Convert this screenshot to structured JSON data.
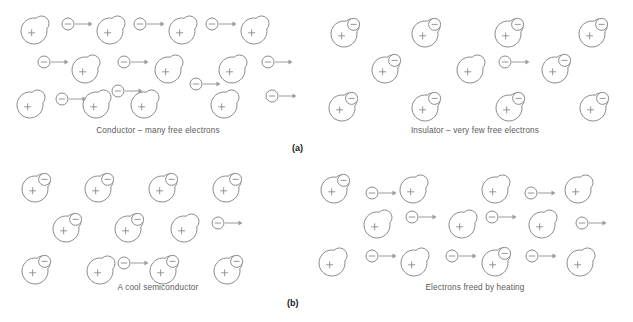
{
  "figure": {
    "width": 633,
    "height": 322,
    "background": "#ffffff",
    "stroke_color": "#8a8a8a",
    "arrow_color": "#9a9a9a",
    "caption_color": "#5b5b5b",
    "label_color": "#1a1a1a"
  },
  "geometry": {
    "atom_radius": 13,
    "electron_radius": 6,
    "arrow_length": 17
  },
  "panel_labels": [
    {
      "text": "(a)",
      "x": 292,
      "y": 143
    },
    {
      "text": "(b)",
      "x": 287,
      "y": 298
    }
  ],
  "panels": [
    {
      "id": "conductor",
      "name": "conductor-panel",
      "caption": "Conductor – many free electrons",
      "x": 0,
      "y": 0,
      "width": 316,
      "height": 160,
      "caption_y": 126,
      "atoms": [
        {
          "x": 34,
          "y": 31,
          "bound_electron": false
        },
        {
          "x": 110,
          "y": 31,
          "bound_electron": false
        },
        {
          "x": 182,
          "y": 31,
          "bound_electron": false
        },
        {
          "x": 254,
          "y": 31,
          "bound_electron": false
        },
        {
          "x": 85,
          "y": 70,
          "bound_electron": false
        },
        {
          "x": 168,
          "y": 70,
          "bound_electron": false
        },
        {
          "x": 232,
          "y": 70,
          "bound_electron": false
        },
        {
          "x": 30,
          "y": 105,
          "bound_electron": false
        },
        {
          "x": 96,
          "y": 105,
          "bound_electron": false
        },
        {
          "x": 144,
          "y": 105,
          "bound_electron": false
        },
        {
          "x": 224,
          "y": 105,
          "bound_electron": false
        }
      ],
      "electrons": [
        {
          "x": 68,
          "y": 24,
          "arrow": true
        },
        {
          "x": 140,
          "y": 24,
          "arrow": true
        },
        {
          "x": 212,
          "y": 24,
          "arrow": true
        },
        {
          "x": 44,
          "y": 62,
          "arrow": true
        },
        {
          "x": 124,
          "y": 62,
          "arrow": true
        },
        {
          "x": 196,
          "y": 84,
          "arrow": true
        },
        {
          "x": 268,
          "y": 62,
          "arrow": true
        },
        {
          "x": 272,
          "y": 96,
          "arrow": true
        },
        {
          "x": 62,
          "y": 99,
          "arrow": true
        },
        {
          "x": 118,
          "y": 91,
          "arrow": true
        }
      ]
    },
    {
      "id": "insulator",
      "name": "insulator-panel",
      "caption": "Insulator – very few free electrons",
      "x": 317,
      "y": 0,
      "width": 316,
      "height": 160,
      "caption_y": 126,
      "atoms": [
        {
          "x": 27,
          "y": 34,
          "bound_electron": true
        },
        {
          "x": 108,
          "y": 34,
          "bound_electron": true
        },
        {
          "x": 191,
          "y": 34,
          "bound_electron": true
        },
        {
          "x": 275,
          "y": 34,
          "bound_electron": true
        },
        {
          "x": 68,
          "y": 70,
          "bound_electron": true
        },
        {
          "x": 153,
          "y": 70,
          "bound_electron": false
        },
        {
          "x": 238,
          "y": 70,
          "bound_electron": true
        },
        {
          "x": 25,
          "y": 108,
          "bound_electron": true
        },
        {
          "x": 108,
          "y": 108,
          "bound_electron": true
        },
        {
          "x": 192,
          "y": 108,
          "bound_electron": true
        },
        {
          "x": 276,
          "y": 108,
          "bound_electron": true
        }
      ],
      "electrons": [
        {
          "x": 188,
          "y": 62,
          "arrow": true
        }
      ]
    },
    {
      "id": "cool-semiconductor",
      "name": "cool-semiconductor-panel",
      "caption": "A cool semiconductor",
      "x": 0,
      "y": 161,
      "width": 316,
      "height": 161,
      "caption_y": 122,
      "atoms": [
        {
          "x": 35,
          "y": 28,
          "bound_electron": true
        },
        {
          "x": 98,
          "y": 28,
          "bound_electron": true
        },
        {
          "x": 162,
          "y": 28,
          "bound_electron": true
        },
        {
          "x": 226,
          "y": 28,
          "bound_electron": true
        },
        {
          "x": 66,
          "y": 68,
          "bound_electron": true
        },
        {
          "x": 128,
          "y": 68,
          "bound_electron": true
        },
        {
          "x": 184,
          "y": 68,
          "bound_electron": false
        },
        {
          "x": 35,
          "y": 110,
          "bound_electron": true
        },
        {
          "x": 100,
          "y": 110,
          "bound_electron": false
        },
        {
          "x": 163,
          "y": 110,
          "bound_electron": true
        },
        {
          "x": 227,
          "y": 110,
          "bound_electron": true
        }
      ],
      "electrons": [
        {
          "x": 218,
          "y": 62,
          "arrow": true
        },
        {
          "x": 124,
          "y": 102,
          "arrow": true
        }
      ]
    },
    {
      "id": "heated-semiconductor",
      "name": "heated-semiconductor-panel",
      "caption": "Electrons freed by heating",
      "x": 317,
      "y": 161,
      "width": 316,
      "height": 161,
      "caption_y": 122,
      "atoms": [
        {
          "x": 17,
          "y": 29,
          "bound_electron": true
        },
        {
          "x": 96,
          "y": 29,
          "bound_electron": false
        },
        {
          "x": 178,
          "y": 29,
          "bound_electron": false
        },
        {
          "x": 261,
          "y": 29,
          "bound_electron": false
        },
        {
          "x": 60,
          "y": 64,
          "bound_electron": false
        },
        {
          "x": 145,
          "y": 64,
          "bound_electron": false
        },
        {
          "x": 225,
          "y": 64,
          "bound_electron": false
        },
        {
          "x": 15,
          "y": 102,
          "bound_electron": false
        },
        {
          "x": 97,
          "y": 102,
          "bound_electron": false
        },
        {
          "x": 178,
          "y": 102,
          "bound_electron": true
        },
        {
          "x": 263,
          "y": 102,
          "bound_electron": false
        }
      ],
      "electrons": [
        {
          "x": 55,
          "y": 32,
          "arrow": true
        },
        {
          "x": 214,
          "y": 32,
          "arrow": true
        },
        {
          "x": 95,
          "y": 56,
          "arrow": true
        },
        {
          "x": 175,
          "y": 56,
          "arrow": true
        },
        {
          "x": 265,
          "y": 62,
          "arrow": true
        },
        {
          "x": 55,
          "y": 95,
          "arrow": true
        },
        {
          "x": 135,
          "y": 95,
          "arrow": true
        },
        {
          "x": 215,
          "y": 95,
          "arrow": true
        }
      ]
    }
  ]
}
